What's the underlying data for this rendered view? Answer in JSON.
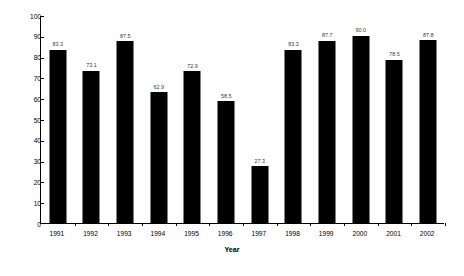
{
  "chart_data": {
    "type": "bar",
    "title": "",
    "xlabel": "Year",
    "ylabel": "Percentage of Entrants that Survive",
    "categories": [
      "1991",
      "1992",
      "1993",
      "1994",
      "1995",
      "1996",
      "1997",
      "1998",
      "1999",
      "2000",
      "2001",
      "2002"
    ],
    "values": [
      83.3,
      73.1,
      87.5,
      62.9,
      72.9,
      58.5,
      27.3,
      83.3,
      87.7,
      90.0,
      78.5,
      87.8
    ],
    "value_labels": [
      "83.3",
      "73.1",
      "87.5",
      "62.9",
      "72.9",
      "58.5",
      "27.3",
      "83.3",
      "87.7",
      "90.0",
      "78.5",
      "87.8"
    ],
    "ylim": [
      0,
      100
    ],
    "y_ticks": [
      0,
      10,
      20,
      30,
      40,
      50,
      60,
      70,
      80,
      90,
      100
    ],
    "y_tick_labels": [
      "0",
      "10",
      "20",
      "30",
      "40",
      "50",
      "60",
      "70",
      "80",
      "90",
      "100"
    ],
    "grid": false,
    "legend": null,
    "bar_color": "#000000",
    "axis_color": "#000000",
    "label_color": "#3a3a3a",
    "background": "#ffffff"
  }
}
